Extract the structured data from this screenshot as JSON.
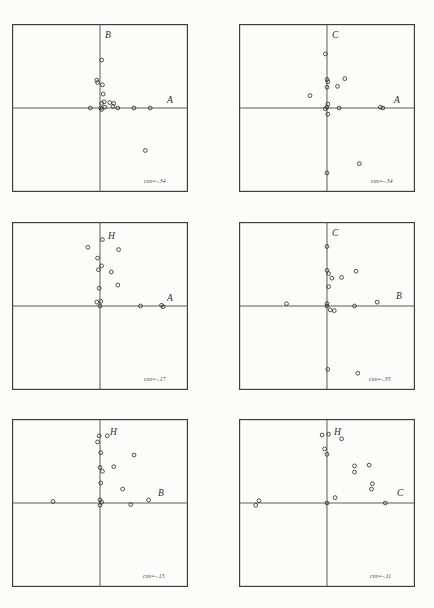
{
  "document": {
    "type": "scanned-figure-page",
    "page_number": "",
    "background_color": "#fcfcfb",
    "ink_color": "#333333"
  },
  "figure": {
    "layout": {
      "rows": 3,
      "cols": 2,
      "panel_count": 6
    },
    "panels": [
      {
        "id": "panel-1",
        "row": 0,
        "col": 0,
        "x_axis_label": "A",
        "y_axis_label": "B",
        "cos_label": "cos=-.34",
        "chart_data": {
          "type": "scatter",
          "title": "",
          "xlabel": "A",
          "ylabel": "B",
          "xlim": [
            -1,
            1
          ],
          "ylim": [
            -1,
            1
          ],
          "grid": false,
          "axes_through_origin": true,
          "legend": "none",
          "annotation": "cos=-.34",
          "points": [
            [
              0.02,
              0.62
            ],
            [
              -0.04,
              0.36
            ],
            [
              -0.03,
              0.33
            ],
            [
              0.03,
              0.3
            ],
            [
              0.04,
              0.18
            ],
            [
              0.05,
              0.08
            ],
            [
              0.02,
              0.06
            ],
            [
              0.12,
              0.07
            ],
            [
              0.17,
              0.06
            ],
            [
              0.16,
              0.02
            ],
            [
              0.06,
              0.01
            ],
            [
              0.01,
              0.0
            ],
            [
              0.02,
              -0.02
            ],
            [
              -0.12,
              0.0
            ],
            [
              0.22,
              0.0
            ],
            [
              0.42,
              0.0
            ],
            [
              0.62,
              0.0
            ],
            [
              0.56,
              -0.55
            ]
          ]
        }
      },
      {
        "id": "panel-2",
        "row": 0,
        "col": 1,
        "x_axis_label": "A",
        "y_axis_label": "C",
        "cos_label": "cos=-.34",
        "chart_data": {
          "type": "scatter",
          "title": "",
          "xlabel": "A",
          "ylabel": "C",
          "xlim": [
            -1,
            1
          ],
          "ylim": [
            -1,
            1
          ],
          "grid": false,
          "axes_through_origin": true,
          "legend": "none",
          "annotation": "cos=-.34",
          "points": [
            [
              -0.02,
              0.7
            ],
            [
              0.0,
              0.37
            ],
            [
              0.01,
              0.34
            ],
            [
              0.0,
              0.27
            ],
            [
              0.22,
              0.38
            ],
            [
              0.13,
              0.28
            ],
            [
              -0.21,
              0.16
            ],
            [
              0.01,
              0.05
            ],
            [
              0.0,
              0.01
            ],
            [
              -0.02,
              -0.01
            ],
            [
              0.01,
              -0.08
            ],
            [
              0.15,
              0.0
            ],
            [
              0.66,
              0.01
            ],
            [
              0.69,
              0.0
            ],
            [
              0.0,
              -0.84
            ],
            [
              0.4,
              -0.72
            ]
          ]
        }
      },
      {
        "id": "panel-3",
        "row": 1,
        "col": 0,
        "x_axis_label": "A",
        "y_axis_label": "H",
        "cos_label": "cos=-.17",
        "chart_data": {
          "type": "scatter",
          "title": "",
          "xlabel": "A",
          "ylabel": "H",
          "xlim": [
            -1,
            1
          ],
          "ylim": [
            -1,
            1
          ],
          "grid": false,
          "axes_through_origin": true,
          "legend": "none",
          "annotation": "cos=-.17",
          "points": [
            [
              0.03,
              0.86
            ],
            [
              -0.15,
              0.76
            ],
            [
              -0.03,
              0.62
            ],
            [
              0.02,
              0.52
            ],
            [
              -0.02,
              0.47
            ],
            [
              0.23,
              0.73
            ],
            [
              0.14,
              0.44
            ],
            [
              0.22,
              0.27
            ],
            [
              -0.01,
              0.23
            ],
            [
              -0.04,
              0.05
            ],
            [
              0.01,
              0.06
            ],
            [
              0.0,
              0.0
            ],
            [
              0.5,
              0.0
            ],
            [
              0.76,
              0.01
            ],
            [
              0.78,
              -0.01
            ]
          ]
        }
      },
      {
        "id": "panel-4",
        "row": 1,
        "col": 1,
        "x_axis_label": "B",
        "y_axis_label": "C",
        "cos_label": "cos=-.35",
        "chart_data": {
          "type": "scatter",
          "title": "",
          "xlabel": "B",
          "ylabel": "C",
          "xlim": [
            -1,
            1
          ],
          "ylim": [
            -1,
            1
          ],
          "grid": false,
          "axes_through_origin": true,
          "legend": "none",
          "annotation": "cos=-.35",
          "points": [
            [
              0.0,
              0.77
            ],
            [
              0.0,
              0.46
            ],
            [
              0.02,
              0.42
            ],
            [
              0.06,
              0.36
            ],
            [
              0.18,
              0.37
            ],
            [
              0.36,
              0.45
            ],
            [
              0.02,
              0.25
            ],
            [
              0.0,
              0.03
            ],
            [
              0.0,
              0.0
            ],
            [
              0.04,
              -0.05
            ],
            [
              0.09,
              -0.06
            ],
            [
              -0.5,
              0.03
            ],
            [
              0.34,
              0.0
            ],
            [
              0.62,
              0.05
            ],
            [
              0.01,
              -0.82
            ],
            [
              0.38,
              -0.87
            ]
          ]
        }
      },
      {
        "id": "panel-5",
        "row": 2,
        "col": 0,
        "x_axis_label": "B",
        "y_axis_label": "H",
        "cos_label": "cos=-.15",
        "chart_data": {
          "type": "scatter",
          "title": "",
          "xlabel": "B",
          "ylabel": "H",
          "xlim": [
            -1,
            1
          ],
          "ylim": [
            -1,
            1
          ],
          "grid": false,
          "axes_through_origin": true,
          "legend": "none",
          "annotation": "cos=-.15",
          "points": [
            [
              -0.01,
              0.87
            ],
            [
              0.09,
              0.87
            ],
            [
              -0.03,
              0.79
            ],
            [
              0.01,
              0.65
            ],
            [
              0.42,
              0.62
            ],
            [
              0.0,
              0.46
            ],
            [
              0.17,
              0.47
            ],
            [
              0.03,
              0.41
            ],
            [
              0.01,
              0.26
            ],
            [
              0.28,
              0.18
            ],
            [
              0.0,
              0.04
            ],
            [
              0.02,
              0.01
            ],
            [
              0.0,
              -0.03
            ],
            [
              -0.58,
              0.02
            ],
            [
              0.38,
              -0.02
            ],
            [
              0.6,
              0.04
            ]
          ]
        }
      },
      {
        "id": "panel-6",
        "row": 2,
        "col": 1,
        "x_axis_label": "C",
        "y_axis_label": "H",
        "cos_label": "cos=-.11",
        "chart_data": {
          "type": "scatter",
          "title": "",
          "xlabel": "C",
          "ylabel": "H",
          "xlim": [
            -1,
            1
          ],
          "ylim": [
            -1,
            1
          ],
          "grid": false,
          "axes_through_origin": true,
          "legend": "none",
          "annotation": "cos=-.11",
          "points": [
            [
              -0.06,
              0.88
            ],
            [
              0.02,
              0.89
            ],
            [
              0.18,
              0.83
            ],
            [
              -0.03,
              0.7
            ],
            [
              0.0,
              0.63
            ],
            [
              0.34,
              0.48
            ],
            [
              0.52,
              0.49
            ],
            [
              0.34,
              0.4
            ],
            [
              0.56,
              0.25
            ],
            [
              0.55,
              0.18
            ],
            [
              0.1,
              0.07
            ],
            [
              0.0,
              0.0
            ],
            [
              -0.84,
              0.03
            ],
            [
              -0.88,
              -0.03
            ],
            [
              0.72,
              0.0
            ]
          ]
        }
      }
    ]
  }
}
